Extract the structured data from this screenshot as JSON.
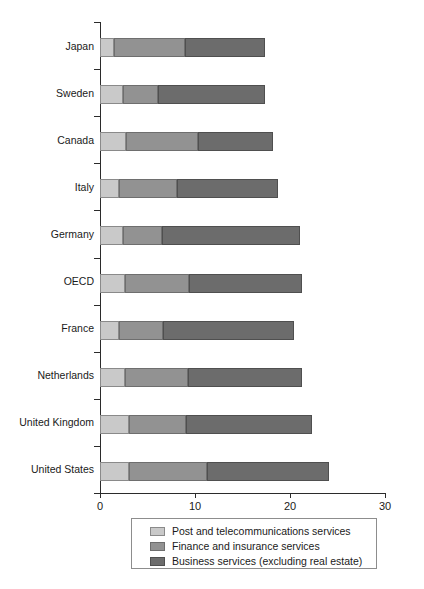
{
  "chart_data": {
    "type": "bar",
    "orientation": "horizontal",
    "stacked": true,
    "title": "",
    "subtitle": "",
    "xlabel": "",
    "ylabel": "",
    "xlim": [
      0,
      30
    ],
    "xticks": [
      0,
      10,
      20,
      30
    ],
    "xtick_labels": [
      "0",
      "10",
      "20",
      "30"
    ],
    "grid": false,
    "legend_position": "bottom-center",
    "categories": [
      "Japan",
      "Sweden",
      "Canada",
      "Italy",
      "Germany",
      "OECD",
      "France",
      "Netherlands",
      "United Kingdom",
      "United States"
    ],
    "series": [
      {
        "name": "Post and telecommunications services",
        "color": "#c9c9c9",
        "values": [
          1.5,
          2.4,
          2.7,
          2.0,
          2.4,
          2.6,
          2.0,
          2.6,
          3.0,
          3.1
        ]
      },
      {
        "name": "Finance and insurance services",
        "color": "#929292",
        "values": [
          7.4,
          3.7,
          7.6,
          6.1,
          4.1,
          6.8,
          4.6,
          6.7,
          6.1,
          8.2
        ]
      },
      {
        "name": "Business services (excluding real estate)",
        "color": "#6c6c6c",
        "values": [
          8.5,
          11.3,
          7.9,
          10.6,
          14.5,
          11.9,
          13.8,
          12.0,
          13.2,
          12.8
        ]
      }
    ],
    "totals": [
      17.4,
      17.4,
      18.2,
      18.7,
      21.0,
      21.3,
      20.4,
      21.3,
      22.3,
      24.1
    ]
  },
  "legend": {
    "items": [
      "Post and telecommunications services",
      "Finance and insurance services",
      "Business services (excluding real estate)"
    ]
  }
}
